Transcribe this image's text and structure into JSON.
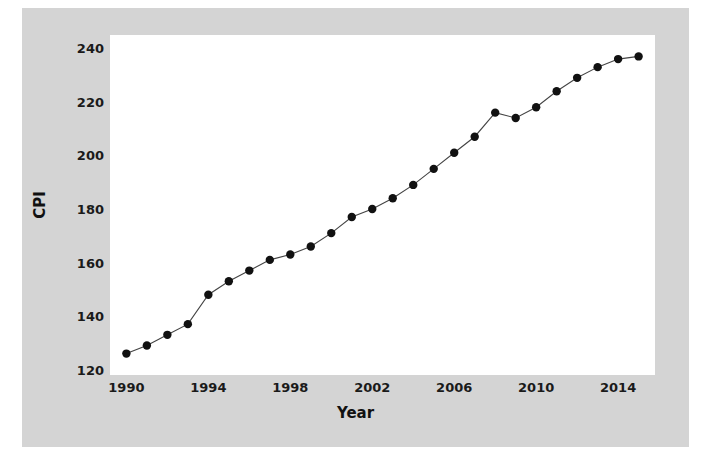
{
  "figure": {
    "background_color": "#d4d4d4",
    "plot_background_color": "#ffffff",
    "marker_color": "#111111",
    "line_color": "#444444"
  },
  "axes": {
    "y_label": "CPI",
    "x_label": "Year",
    "y_ticks": [
      "240",
      "220",
      "200",
      "180",
      "160",
      "140",
      "120"
    ],
    "x_ticks": [
      "1990",
      "1994",
      "1998",
      "2002",
      "2006",
      "2010",
      "2014"
    ]
  },
  "chart_data": {
    "type": "line",
    "title": "",
    "xlabel": "Year",
    "ylabel": "CPI",
    "xlim": [
      1989.2,
      2015.8
    ],
    "ylim": [
      118,
      245
    ],
    "yticks": [
      120,
      140,
      160,
      180,
      200,
      220,
      240
    ],
    "xticks": [
      1990,
      1994,
      1998,
      2002,
      2006,
      2010,
      2014
    ],
    "grid": false,
    "legend": false,
    "markers": "filled-circle",
    "x": [
      1990,
      1991,
      1992,
      1993,
      1994,
      1995,
      1996,
      1997,
      1998,
      1999,
      2000,
      2001,
      2002,
      2003,
      2004,
      2005,
      2006,
      2007,
      2008,
      2009,
      2010,
      2011,
      2012,
      2013,
      2014,
      2015
    ],
    "values": [
      126,
      129,
      133,
      137,
      148,
      153,
      157,
      161,
      163,
      166,
      171,
      177,
      180,
      184,
      189,
      195,
      201,
      207,
      216,
      214,
      218,
      224,
      229,
      233,
      236,
      237
    ],
    "series": [
      {
        "name": "CPI",
        "values": [
          126,
          129,
          133,
          137,
          148,
          153,
          157,
          161,
          163,
          166,
          171,
          177,
          180,
          184,
          189,
          195,
          201,
          207,
          216,
          214,
          218,
          224,
          229,
          233,
          236,
          237
        ]
      }
    ]
  }
}
